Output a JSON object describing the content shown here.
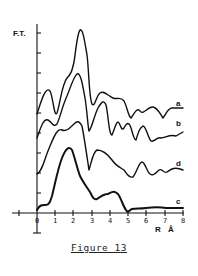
{
  "figure": {
    "caption": "Figure 13",
    "y_axis_label": "F.T.",
    "x_axis_label": "R",
    "x_axis_unit": "Å",
    "x_tick_labels": [
      "0",
      "1",
      "2",
      "3",
      "4",
      "5",
      "6",
      "7",
      "8"
    ],
    "curve_labels": [
      "a",
      "b",
      "d",
      "c"
    ]
  },
  "chart_data": {
    "type": "line",
    "title": "Figure 13",
    "xlabel": "R (Å)",
    "ylabel": "F.T.",
    "xlim": [
      -1,
      8
    ],
    "x_ticks": [
      0,
      1,
      2,
      3,
      4,
      5,
      6,
      7,
      8
    ],
    "y_ticks_count": 10,
    "grid": false,
    "legend": "inline labels at right end of each curve",
    "series": [
      {
        "name": "a",
        "x": [
          0,
          0.5,
          1.0,
          1.4,
          1.7,
          2.1,
          2.5,
          2.8,
          3.2,
          3.6,
          4.0,
          4.4,
          4.8,
          5.1,
          5.5,
          5.8,
          6.2,
          6.6,
          7.0,
          7.4,
          7.9
        ],
        "y": [
          5.2,
          6.2,
          5.1,
          6.8,
          7.3,
          9.0,
          7.3,
          5.6,
          6.3,
          6.0,
          5.8,
          5.9,
          5.2,
          4.8,
          5.4,
          5.1,
          5.4,
          5.3,
          4.7,
          5.2,
          5.2
        ]
      },
      {
        "name": "b",
        "x": [
          0,
          0.5,
          1.0,
          1.4,
          1.7,
          2.1,
          2.5,
          2.8,
          3.2,
          3.6,
          4.0,
          4.4,
          4.8,
          5.1,
          5.5,
          5.8,
          6.2,
          6.6,
          7.0,
          7.4,
          7.9
        ],
        "y": [
          3.9,
          4.7,
          4.4,
          5.4,
          6.4,
          7.0,
          5.6,
          4.0,
          5.1,
          5.7,
          3.8,
          4.6,
          4.2,
          4.5,
          3.6,
          4.3,
          3.9,
          3.4,
          3.6,
          3.6,
          3.9
        ]
      },
      {
        "name": "d",
        "x": [
          0,
          0.5,
          1.0,
          1.4,
          1.7,
          2.1,
          2.5,
          2.8,
          3.2,
          3.6,
          4.0,
          4.4,
          4.8,
          5.1,
          5.5,
          5.8,
          6.2,
          6.6,
          7.0,
          7.4,
          7.9
        ],
        "y": [
          1.9,
          2.6,
          3.9,
          4.3,
          4.4,
          4.8,
          4.0,
          2.1,
          3.2,
          3.0,
          2.9,
          2.6,
          2.1,
          1.9,
          2.5,
          2.6,
          2.1,
          1.9,
          2.1,
          2.1,
          2.0
        ]
      },
      {
        "name": "c",
        "x": [
          0,
          0.3,
          0.7,
          1.0,
          1.4,
          1.7,
          2.0,
          2.4,
          2.8,
          3.2,
          3.6,
          4.0,
          4.4,
          4.8,
          5.0,
          5.3,
          5.8,
          6.3,
          6.8,
          7.3,
          7.9
        ],
        "y": [
          0.2,
          0.5,
          0.6,
          1.6,
          3.2,
          3.4,
          2.6,
          1.6,
          1.1,
          0.7,
          0.9,
          1.2,
          1.1,
          0.3,
          0.1,
          0.3,
          0.3,
          0.3,
          0.4,
          0.3,
          0.3
        ]
      }
    ]
  },
  "render": {
    "paths": {
      "a": "M37,114 C42,98 46,86 50,91 C53,96 54,118 57,113 C60,104 62,84 67,78 C71,74 72,71 74,62 C76,50 77,34 80,30 C83,28 85,44 87,55 C89,70 89,98 92,104 C95,108 96,96 100,93 C104,90 108,96 113,98 C117,100 120,96 124,101 C127,106 128,116 131,118 C134,114 137,107 140,111 C143,116 148,106 153,107 C158,108 160,114 163,118 C166,114 168,108 172,108 L183,108",
      "b": "M37,138 C40,130 43,118 48,120 C52,122 53,128 57,124 C60,118 63,104 67,96 C71,86 74,76 77,74 C81,72 83,88 85,98 C87,110 88,128 89,131 C92,128 94,116 98,108 C102,101 104,100 106,105 C108,112 109,136 112,135 C115,128 116,122 118,122 C121,124 121,132 124,128 C127,122 129,122 131,128 C133,134 134,140 136,140 C139,130 140,128 143,126 C146,126 148,138 151,141 C154,143 157,136 161,138 C165,138 170,134 176,136 L183,132",
      "d": "M37,174 C42,172 44,160 50,146 C55,134 58,128 62,130 C66,132 70,128 74,124 C78,120 80,122 82,126 C84,136 86,150 89,170 C92,160 93,152 97,150 C101,150 106,152 112,160 C116,166 121,168 124,170 C127,174 129,178 133,177 C137,172 139,162 142,162 C145,162 147,172 150,174 C153,176 155,174 159,170 C162,168 164,174 167,172 C170,170 174,166 183,170",
      "c": "M37,210 C40,204 43,205 46,205 C49,205 50,202 52,196 C55,184 58,168 62,158 C66,148 69,146 72,150 C75,158 77,168 80,176 C83,182 86,186 90,192 C93,198 94,200 97,199 C101,196 104,194 108,194 C112,192 114,190 118,194 C121,198 123,206 126,210 C128,214 129,210 132,209 C136,208 140,209 146,208 C154,207 160,207 166,208 C172,208 176,208 183,208"
    },
    "stroke_widths": {
      "a": 1.4,
      "b": 1.4,
      "d": 1.4,
      "c": 2.0
    },
    "label_positions": {
      "a": [
        176,
        106
      ],
      "b": [
        176,
        126
      ],
      "d": [
        176,
        166
      ],
      "c": [
        176,
        204
      ]
    }
  }
}
